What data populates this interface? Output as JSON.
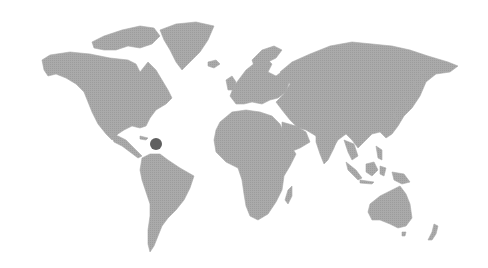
{
  "map": {
    "type": "world-map",
    "land_color": "#a6a6a6",
    "background_color": "#ffffff",
    "markers": [
      {
        "id": "caribbean",
        "x": 156,
        "y": 144,
        "radius": 6,
        "color": "#5f5f5f"
      }
    ]
  }
}
